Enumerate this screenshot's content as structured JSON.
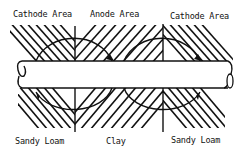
{
  "diagram": {
    "top_labels": {
      "left": "Cathode Area",
      "middle": "Anode Area",
      "right": "Cathode Area"
    },
    "bottom_labels": {
      "left": "Sandy Loam",
      "middle": "Clay",
      "right": "Sandy Loam"
    },
    "colors": {
      "ink": "#111111",
      "background": "#ffffff"
    }
  }
}
